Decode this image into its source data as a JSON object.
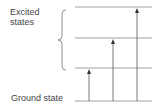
{
  "diagram": {
    "excited_label_line1": "Excited",
    "excited_label_line2": "states",
    "ground_label": "Ground state",
    "levels": [
      {
        "name": "excited-level-3",
        "y": 7
      },
      {
        "name": "excited-level-2",
        "y": 38
      },
      {
        "name": "excited-level-1",
        "y": 68
      },
      {
        "name": "ground-level",
        "y": 101
      }
    ],
    "transitions": [
      {
        "name": "transition-to-level-1",
        "x": 89,
        "from_y": 101,
        "to_y": 68
      },
      {
        "name": "transition-to-level-2",
        "x": 113,
        "from_y": 101,
        "to_y": 38
      },
      {
        "name": "transition-to-level-3",
        "x": 137,
        "from_y": 101,
        "to_y": 7
      }
    ],
    "line_color": "#555555",
    "level_color": "#888888"
  }
}
